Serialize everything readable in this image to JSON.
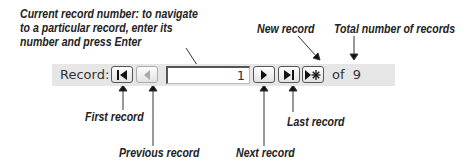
{
  "navigation_bar": {
    "label": "Record:",
    "current_record": "1",
    "of_label": "of",
    "total_records": "9",
    "buttons": {
      "first": {
        "icon": "first-record-icon",
        "enabled": true
      },
      "previous": {
        "icon": "previous-record-icon",
        "enabled": false
      },
      "next": {
        "icon": "next-record-icon",
        "enabled": true
      },
      "last": {
        "icon": "last-record-icon",
        "enabled": true
      },
      "new": {
        "icon": "new-record-icon",
        "enabled": true
      }
    }
  },
  "callouts": {
    "current_record": [
      "Current record number: to navigate",
      "to a particular record, enter its",
      "number and press Enter"
    ],
    "new_record": "New record",
    "total_records": "Total number of records",
    "first_record": "First record",
    "previous_record": "Previous record",
    "next_record": "Next record",
    "last_record": "Last record"
  }
}
